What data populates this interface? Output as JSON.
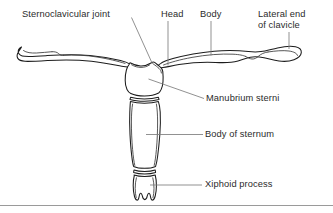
{
  "figure": {
    "background_color": "#ffffff",
    "outline_color": "#1d1d1d",
    "leader_color": "#7d7d7d",
    "text_color": "#2b2b2b",
    "frame_color": "#9a9a9a"
  },
  "labels": {
    "sternoclavicular_joint": "Sternoclavicular joint",
    "head": "Head",
    "body": "Body",
    "lateral_end_line1": "Lateral end",
    "lateral_end_line2": "of clavicle",
    "manubrium_sterni": "Manubrium sterni",
    "body_of_sternum": "Body of sternum",
    "xiphoid_process": "Xiphoid process"
  },
  "structures": [
    {
      "name": "left-clavicle",
      "label": "Lateral end of clavicle"
    },
    {
      "name": "right-clavicle",
      "label": "Lateral end of clavicle"
    },
    {
      "name": "manubrium",
      "label": "Manubrium sterni"
    },
    {
      "name": "sternum-body",
      "label": "Body of sternum"
    },
    {
      "name": "xiphoid",
      "label": "Xiphoid process"
    }
  ]
}
